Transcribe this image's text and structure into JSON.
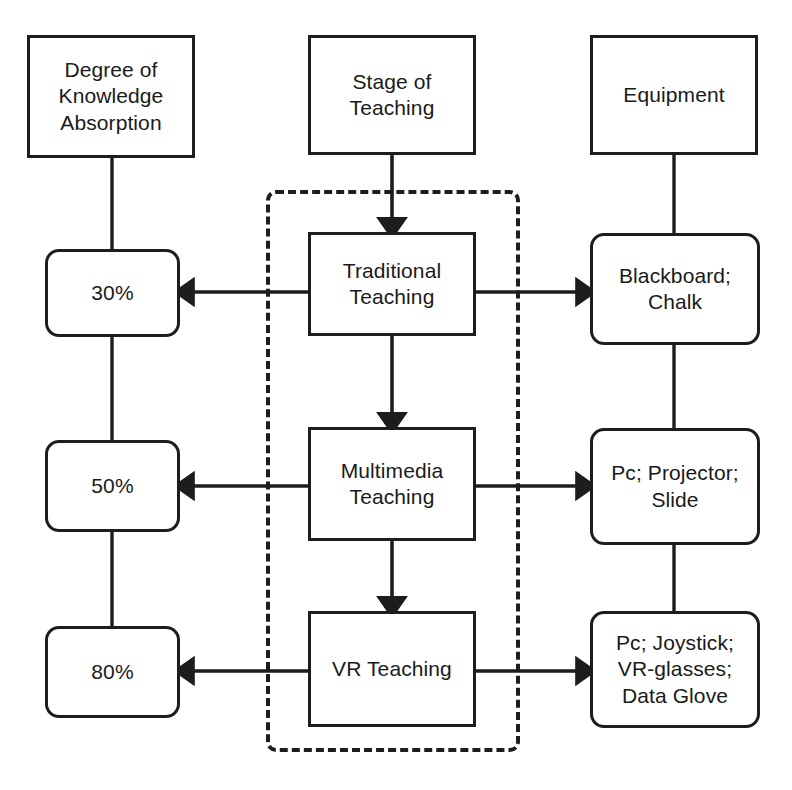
{
  "figure": {
    "ink_color": "#1d1d1d",
    "background_color": "#ffffff"
  },
  "columns": [
    {
      "id": "absorption",
      "header": "Degree of\nKnowledge\nAbsorption"
    },
    {
      "id": "stage",
      "header": "Stage of\nTeaching"
    },
    {
      "id": "equipment",
      "header": "Equipment"
    }
  ],
  "headers": {
    "absorption": "Degree of\nKnowledge\nAbsorption",
    "stage": "Stage of\nTeaching",
    "equipment": "Equipment"
  },
  "rows": [
    {
      "absorption": "30%",
      "stage": "Traditional\nTeaching",
      "equipment": "Blackboard;\nChalk"
    },
    {
      "absorption": "50%",
      "stage": "Multimedia\nTeaching",
      "equipment": "Pc; Projector;\nSlide"
    },
    {
      "absorption": "80%",
      "stage": "VR Teaching",
      "equipment": "Pc; Joystick;\nVR-glasses;\nData Glove"
    }
  ],
  "dashed_region": {
    "label": "teaching-stage-grouping",
    "style": "dashed"
  },
  "edges": [
    {
      "from": "header-absorption",
      "to": "absorption-30",
      "style": "plain-line"
    },
    {
      "from": "absorption-30",
      "to": "absorption-50",
      "style": "plain-line"
    },
    {
      "from": "absorption-50",
      "to": "absorption-80",
      "style": "plain-line"
    },
    {
      "from": "header-stage",
      "to": "stage-traditional",
      "style": "arrow-down"
    },
    {
      "from": "stage-traditional",
      "to": "stage-multimedia",
      "style": "arrow-down"
    },
    {
      "from": "stage-multimedia",
      "to": "stage-vr",
      "style": "arrow-down"
    },
    {
      "from": "header-equipment",
      "to": "equipment-blackboard",
      "style": "plain-line"
    },
    {
      "from": "equipment-blackboard",
      "to": "equipment-projector",
      "style": "plain-line"
    },
    {
      "from": "equipment-projector",
      "to": "equipment-vrkit",
      "style": "plain-line"
    },
    {
      "from": "stage-traditional",
      "to": "absorption-30",
      "style": "arrow-left"
    },
    {
      "from": "stage-multimedia",
      "to": "absorption-50",
      "style": "arrow-left"
    },
    {
      "from": "stage-vr",
      "to": "absorption-80",
      "style": "arrow-left"
    },
    {
      "from": "stage-traditional",
      "to": "equipment-blackboard",
      "style": "arrow-right"
    },
    {
      "from": "stage-multimedia",
      "to": "equipment-projector",
      "style": "arrow-right"
    },
    {
      "from": "stage-vr",
      "to": "equipment-vrkit",
      "style": "arrow-right"
    }
  ],
  "caption": {
    "partial_text": ""
  }
}
